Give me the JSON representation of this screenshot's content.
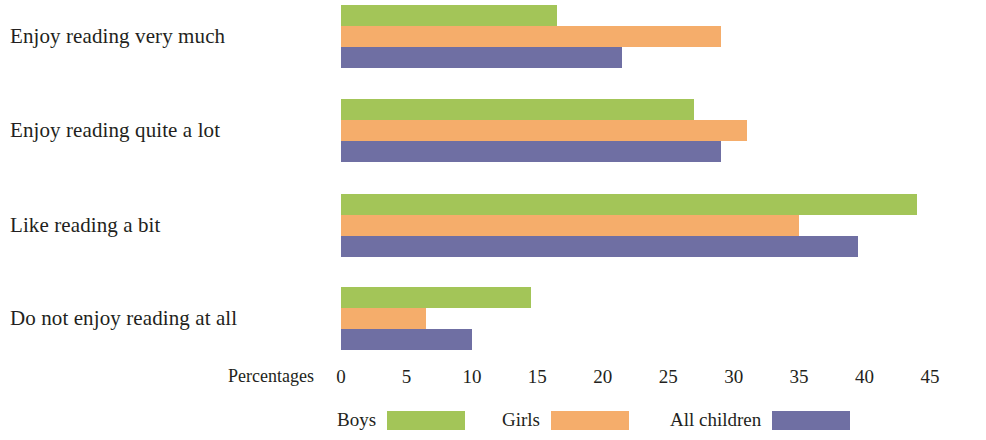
{
  "chart_data": {
    "type": "bar",
    "orientation": "horizontal",
    "title": "",
    "xlabel": "Percentages",
    "ylabel": "",
    "xlim": [
      0,
      45
    ],
    "xticks": [
      0,
      5,
      10,
      15,
      20,
      25,
      30,
      35,
      40,
      45
    ],
    "grid": false,
    "legend_position": "bottom",
    "categories": [
      "Enjoy reading very much",
      "Enjoy reading quite a lot",
      "Like reading a bit",
      "Do not enjoy reading at all"
    ],
    "series": [
      {
        "name": "Boys",
        "color": "#a3c558",
        "values": [
          16.5,
          27.0,
          44.0,
          14.5
        ]
      },
      {
        "name": "Girls",
        "color": "#f5ad6b",
        "values": [
          29.0,
          31.0,
          35.0,
          6.5
        ]
      },
      {
        "name": "All children",
        "color": "#6f6fa3",
        "values": [
          21.5,
          29.0,
          39.5,
          10.0
        ]
      }
    ]
  },
  "axis": {
    "title": "Percentages",
    "ticks": [
      "0",
      "5",
      "10",
      "15",
      "20",
      "25",
      "30",
      "35",
      "40",
      "45"
    ]
  },
  "legend": {
    "items": [
      {
        "label": "Boys"
      },
      {
        "label": "Girls"
      },
      {
        "label": "All children"
      }
    ]
  }
}
